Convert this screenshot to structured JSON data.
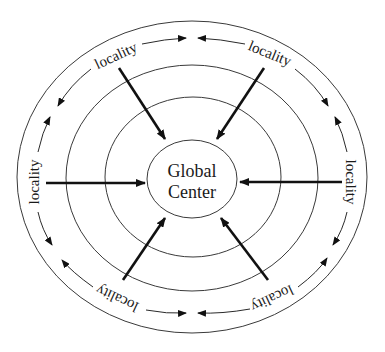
{
  "diagram": {
    "center": {
      "line1": "Global",
      "line2": "Center"
    },
    "localities": [
      {
        "position": "top-left",
        "label": "locality"
      },
      {
        "position": "top-right",
        "label": "locality"
      },
      {
        "position": "right",
        "label": "locality"
      },
      {
        "position": "bottom-right",
        "label": "locality"
      },
      {
        "position": "bottom-left",
        "label": "locality"
      },
      {
        "position": "left",
        "label": "locality"
      }
    ],
    "rings": 4,
    "spoke_direction": "inward to Global Center",
    "perimeter_arrows": "bidirectional between neighboring localities",
    "colors": {
      "line": "#111111",
      "ring": "#3a3a3a",
      "background": "#ffffff"
    }
  }
}
